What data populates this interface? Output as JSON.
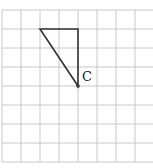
{
  "diagram": {
    "grid": {
      "origin_x": 2,
      "origin_y": 10,
      "cell_size": 19,
      "columns": 8,
      "rows": 8,
      "line_color": "#c8c8c8"
    },
    "triangle": {
      "vertices": [
        {
          "col": 2,
          "row": 1
        },
        {
          "col": 4,
          "row": 1
        },
        {
          "col": 4,
          "row": 4
        }
      ],
      "stroke_color": "#333333"
    },
    "point": {
      "label": "C",
      "col": 4,
      "row": 4
    }
  }
}
